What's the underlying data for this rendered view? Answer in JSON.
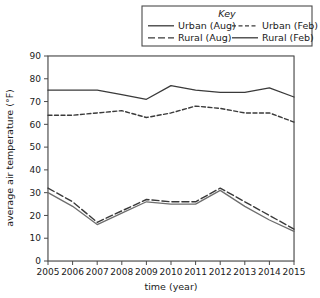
{
  "chart_data": {
    "type": "line",
    "title": "",
    "xlabel": "time (year)",
    "ylabel": "average air temperature (°F)",
    "legend_title": "Key",
    "legend_position": "top-right",
    "grid": true,
    "x": [
      2005,
      2006,
      2007,
      2008,
      2009,
      2010,
      2011,
      2012,
      2013,
      2014,
      2015
    ],
    "categories": [
      "2005",
      "2006",
      "2007",
      "2008",
      "2009",
      "2010",
      "2011",
      "2012",
      "2013",
      "2014",
      "2015"
    ],
    "xlim": [
      2005,
      2015
    ],
    "ylim": [
      0,
      90
    ],
    "yticks": [
      0,
      10,
      20,
      30,
      40,
      50,
      60,
      70,
      80,
      90
    ],
    "ytick_labels": [
      "0",
      "10",
      "20",
      "30",
      "40",
      "50",
      "60",
      "70",
      "80",
      "90"
    ],
    "y_minor_step": 5,
    "series": [
      {
        "name": "Urban (Aug)",
        "style": "solid",
        "color": "#3a3a3a",
        "values": [
          75,
          75,
          75,
          73,
          71,
          77,
          75,
          74,
          74,
          76,
          72
        ]
      },
      {
        "name": "Urban (Feb)",
        "style": "short-dash",
        "color": "#3a3a3a",
        "values": [
          64,
          64,
          65,
          66,
          63,
          65,
          68,
          67,
          65,
          65,
          61
        ]
      },
      {
        "name": "Rural (Aug)",
        "style": "long-dash",
        "color": "#3a3a3a",
        "values": [
          32,
          26,
          17,
          22,
          27,
          26,
          26,
          32,
          26,
          20,
          14
        ]
      },
      {
        "name": "Rural (Feb)",
        "style": "solid",
        "color": "#6e6e6e",
        "values": [
          30,
          24,
          16,
          21,
          26,
          25,
          25,
          31,
          24,
          18,
          13
        ]
      }
    ]
  },
  "legend": {
    "title": "Key",
    "entries": [
      {
        "label": "Urban (Aug)",
        "style": "solid"
      },
      {
        "label": "Urban (Feb)",
        "style": "short-dash"
      },
      {
        "label": "Rural (Aug)",
        "style": "long-dash"
      },
      {
        "label": "Rural (Feb)",
        "style": "solid"
      }
    ]
  },
  "axes": {
    "x_title": "time (year)",
    "y_title": "average air temperature (°F)"
  }
}
